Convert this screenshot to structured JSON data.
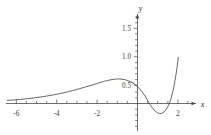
{
  "figure": {
    "background_color": "#ffffff",
    "curve_color": "#555555",
    "axis_color": "#4a4a4a"
  },
  "chart_data": {
    "type": "line",
    "title": "",
    "subtitle": "",
    "xlabel": "x",
    "ylabel": "y",
    "xlim": [
      -6.35,
      2.25
    ],
    "ylim": [
      -0.62,
      1.95
    ],
    "grid": false,
    "legend": null,
    "x_ticks": [
      -6,
      -4,
      -2,
      2
    ],
    "x_tick_labels": [
      "-6",
      "-4",
      "-2",
      "2"
    ],
    "x_minor_ticks": [
      -5.5,
      -5,
      -4.5,
      -3.5,
      -3,
      -2.5,
      -1.5,
      -1,
      -0.5,
      0.5,
      1,
      1.5
    ],
    "y_ticks": [
      0.5,
      1.0,
      1.5
    ],
    "y_tick_labels": [
      "0.5",
      "1.0",
      "1.5"
    ],
    "y_minor_ticks": [
      0.1,
      0.2,
      0.3,
      0.4,
      0.6,
      0.7,
      0.8,
      0.9,
      1.1,
      1.2,
      1.3,
      1.4,
      1.6,
      1.7,
      1.8,
      -0.1,
      -0.2,
      -0.3,
      -0.4,
      -0.5
    ],
    "series": [
      {
        "name": "curve",
        "x": [
          -6.3,
          -6.0,
          -5.7,
          -5.4,
          -5.1,
          -4.8,
          -4.5,
          -4.2,
          -3.9,
          -3.6,
          -3.3,
          -3.0,
          -2.8,
          -2.6,
          -2.4,
          -2.2,
          -2.0,
          -1.9,
          -1.8,
          -1.7,
          -1.6,
          -1.5,
          -1.4,
          -1.3,
          -1.2,
          -1.1,
          -1.0,
          -0.9,
          -0.8,
          -0.7,
          -0.6,
          -0.5,
          -0.4,
          -0.3,
          -0.2,
          -0.1,
          0.0,
          0.1,
          0.2,
          0.3,
          0.4,
          0.5,
          0.6,
          0.7,
          0.8,
          0.9,
          1.0,
          1.05,
          1.1,
          1.15,
          1.2,
          1.25,
          1.3,
          1.35,
          1.4,
          1.45
        ],
        "y": [
          0.085,
          0.098,
          0.113,
          0.131,
          0.152,
          0.176,
          0.204,
          0.236,
          0.272,
          0.313,
          0.358,
          0.408,
          0.443,
          0.479,
          0.516,
          0.553,
          0.589,
          0.606,
          0.622,
          0.636,
          0.648,
          0.658,
          0.665,
          0.669,
          0.669,
          0.664,
          0.655,
          0.64,
          0.619,
          0.591,
          0.556,
          0.513,
          0.461,
          0.399,
          0.327,
          0.244,
          0.15,
          0.045,
          -0.055,
          -0.14,
          -0.207,
          -0.253,
          -0.275,
          -0.27,
          -0.234,
          -0.163,
          -0.054,
          0.018,
          0.104,
          0.206,
          0.326,
          0.466,
          0.627,
          0.812,
          1.022,
          1.26
        ]
      }
    ],
    "annotations": [],
    "features": {
      "local_maximum": {
        "x": -1.25,
        "y": 0.67
      },
      "local_minimum": {
        "x": 0.62,
        "y": -0.28
      },
      "x_intercepts": [
        0.13,
        1.08
      ]
    }
  }
}
